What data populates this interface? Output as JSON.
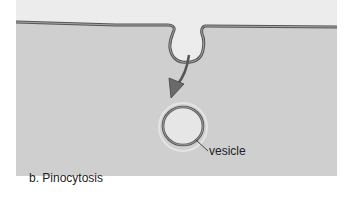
{
  "figure": {
    "caption": "b. Pinocytosis",
    "labels": {
      "vesicle": "vesicle"
    },
    "colors": {
      "extracellular": "#ececec",
      "cytoplasm": "#cfcfcf",
      "membrane_outline": "#555555",
      "membrane_fill": "#9a9a9a",
      "vesicle_interior": "#e6e6e6",
      "arrow": "#666666"
    },
    "elements": [
      {
        "name": "plasma-membrane",
        "type": "membrane-line"
      },
      {
        "name": "membrane-invagination",
        "type": "pit"
      },
      {
        "name": "inward-arrow",
        "type": "arrow"
      },
      {
        "name": "vesicle",
        "type": "circle"
      }
    ]
  }
}
